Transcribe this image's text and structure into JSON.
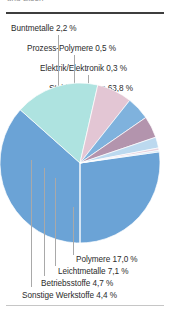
{
  "figure": {
    "clipped_top_text": "und Eisen",
    "background": "#ffffff",
    "rule_top_color": "#3d3d3d",
    "rule_bottom_color": "#c6c6c6"
  },
  "chart_data": {
    "type": "pie",
    "title": "",
    "unit": "%",
    "total": 100.0,
    "categories": [
      "Stahl und Eisen",
      "Polymere",
      "Leichtmetalle",
      "Betriebsstoffe",
      "Sonstige Werkstoffe",
      "Buntmetalle",
      "Prozess-Polymere",
      "Elektrik/Elektronik"
    ],
    "values": [
      63.8,
      17.0,
      7.1,
      4.7,
      4.4,
      2.2,
      0.5,
      0.3
    ],
    "value_labels": [
      "63,8 %",
      "17,0 %",
      "7,1 %",
      "4,7 %",
      "4,4 %",
      "2,2 %",
      "0,5 %",
      "0,3 %"
    ],
    "colors": [
      "#6ba3d6",
      "#aee3e0",
      "#e3c6d4",
      "#7fb2dd",
      "#b394ad",
      "#bcd9ef",
      "#e8d2de",
      "#cfe3f4"
    ],
    "legend_position": "callout-labels",
    "grid": false
  },
  "labels": [
    {
      "id": "buntmetalle",
      "text": "Buntmetalle 2,2 %"
    },
    {
      "id": "prozess-polymere",
      "text": "Prozess-Polymere 0,5 %"
    },
    {
      "id": "elektrik",
      "text": "Elektrik/Elektronik 0,3 %"
    },
    {
      "id": "stahl-eisen",
      "text": "Stahl und Eisen 63,8 %"
    },
    {
      "id": "polymere",
      "text": "Polymere 17,0 %"
    },
    {
      "id": "leichtmetalle",
      "text": "Leichtmetalle 7,1 %"
    },
    {
      "id": "betriebsstoffe",
      "text": "Betriebsstoffe 4,7 %"
    },
    {
      "id": "sonstige",
      "text": "Sonstige Werkstoffe 4,4 %"
    }
  ]
}
